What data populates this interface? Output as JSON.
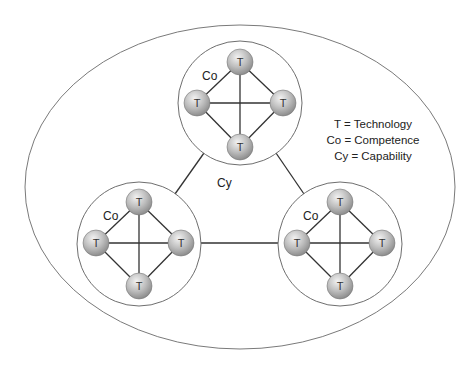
{
  "diagram": {
    "outer_label": "Cy",
    "cluster_label": "Co",
    "node_label": "T",
    "legend": [
      "T = Technology",
      "Co = Competence",
      "Cy = Capability"
    ],
    "clusters": [
      {
        "id": "top",
        "label": "Co",
        "nodes": [
          "T",
          "T",
          "T",
          "T"
        ]
      },
      {
        "id": "bottom-left",
        "label": "Co",
        "nodes": [
          "T",
          "T",
          "T",
          "T"
        ]
      },
      {
        "id": "bottom-right",
        "label": "Co",
        "nodes": [
          "T",
          "T",
          "T",
          "T"
        ]
      }
    ],
    "colors": {
      "outer_ellipse": "#7a7a7a",
      "cluster_circle": "#6e6e6e",
      "edge": "#333333",
      "node_fill_light": "#e8e8e8",
      "node_fill_dark": "#9a9a9a"
    }
  }
}
